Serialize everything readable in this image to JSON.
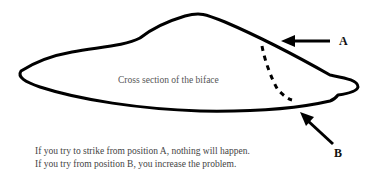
{
  "diagram": {
    "shape_label": "Cross section of the biface",
    "marker_a": "A",
    "marker_b": "B",
    "caption_lines": [
      "If you try to strike from position A, nothing will happen.",
      "If you try from position B, you increase the problem."
    ]
  }
}
